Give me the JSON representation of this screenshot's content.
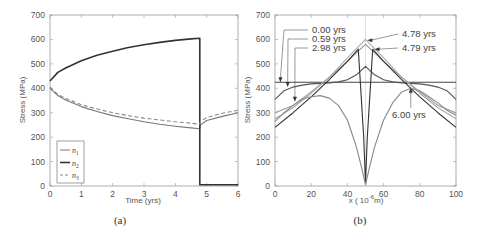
{
  "chart_data": [
    {
      "id": "a",
      "type": "line",
      "caption": "(a)",
      "title": "",
      "xlabel": "Time (yrs)",
      "ylabel": "Stress (MPa)",
      "xlim": [
        0,
        6
      ],
      "ylim": [
        0,
        700
      ],
      "xticks": [
        "0",
        "1",
        "2",
        "3",
        "4",
        "5",
        "6"
      ],
      "yticks": [
        "0",
        "100",
        "200",
        "300",
        "400",
        "500",
        "600",
        "700"
      ],
      "grid": false,
      "legend_position": "lower left",
      "series": [
        {
          "name": "n1",
          "label_base": "n",
          "label_sub": "1",
          "style": "solid-thin",
          "color": "#777777",
          "x": [
            0,
            0.25,
            0.5,
            1,
            1.5,
            2,
            2.5,
            3,
            3.5,
            4,
            4.5,
            4.78,
            4.8,
            5,
            5.5,
            6
          ],
          "y": [
            400,
            370,
            352,
            325,
            305,
            288,
            275,
            263,
            253,
            245,
            238,
            234,
            250,
            268,
            285,
            300
          ]
        },
        {
          "name": "n2",
          "label_base": "n",
          "label_sub": "2",
          "style": "solid-thick",
          "color": "#333333",
          "x": [
            0,
            0.25,
            0.5,
            1,
            1.5,
            2,
            2.5,
            3,
            3.5,
            4,
            4.5,
            4.78,
            4.78,
            4.8,
            5,
            5.5,
            6
          ],
          "y": [
            430,
            465,
            483,
            513,
            535,
            552,
            567,
            578,
            588,
            596,
            602,
            605,
            5,
            5,
            5,
            5,
            5
          ]
        },
        {
          "name": "n3",
          "label_base": "n",
          "label_sub": "3",
          "style": "dashed",
          "color": "#888888",
          "x": [
            0,
            0.25,
            0.5,
            1,
            1.5,
            2,
            2.5,
            3,
            3.5,
            4,
            4.5,
            4.78,
            4.8,
            5,
            5.5,
            6
          ],
          "y": [
            405,
            375,
            358,
            333,
            315,
            300,
            288,
            278,
            270,
            263,
            257,
            253,
            265,
            280,
            298,
            310
          ]
        }
      ]
    },
    {
      "id": "b",
      "type": "line",
      "caption": "(b)",
      "title": "",
      "xlabel": "x ( 10",
      "xlabel_sup": "-6",
      "xlabel_suffix": "m)",
      "ylabel": "Stress (MPa)",
      "xlim": [
        0,
        100
      ],
      "ylim": [
        0,
        700
      ],
      "xticks": [
        "0",
        "20",
        "40",
        "60",
        "80",
        "100"
      ],
      "yticks": [
        "0",
        "100",
        "200",
        "300",
        "400",
        "500",
        "600",
        "700"
      ],
      "grid": false,
      "vertical_reference_x": 50,
      "series": [
        {
          "name": "0.00 yrs",
          "color": "#444444",
          "x": [
            0,
            100
          ],
          "y": [
            425,
            425
          ]
        },
        {
          "name": "0.59 yrs",
          "color": "#555555",
          "x": [
            0,
            5,
            10,
            15,
            20,
            25,
            30,
            35,
            40,
            45,
            50,
            55,
            60,
            65,
            70,
            75,
            80,
            85,
            90,
            95,
            100
          ],
          "y": [
            355,
            390,
            405,
            413,
            418,
            420,
            422,
            426,
            435,
            455,
            490,
            455,
            435,
            426,
            422,
            420,
            418,
            413,
            405,
            390,
            355
          ]
        },
        {
          "name": "2.98 yrs",
          "color": "#999999",
          "x": [
            0,
            10,
            20,
            30,
            40,
            45,
            50,
            55,
            60,
            70,
            80,
            90,
            100
          ],
          "y": [
            300,
            330,
            385,
            445,
            510,
            545,
            580,
            545,
            510,
            445,
            385,
            330,
            300
          ]
        },
        {
          "name": "4.78 yrs",
          "color": "#aaaaaa",
          "x": [
            0,
            10,
            20,
            30,
            40,
            50,
            60,
            70,
            80,
            90,
            100
          ],
          "y": [
            275,
            320,
            380,
            445,
            525,
            600,
            525,
            445,
            380,
            320,
            275
          ]
        },
        {
          "name": "4.79 yrs",
          "color": "#333333",
          "x": [
            0,
            10,
            20,
            30,
            40,
            46,
            49,
            50,
            51,
            54,
            60,
            70,
            80,
            90,
            100
          ],
          "y": [
            240,
            300,
            365,
            435,
            510,
            560,
            200,
            10,
            200,
            560,
            510,
            435,
            365,
            300,
            240
          ]
        },
        {
          "name": "6.00 yrs",
          "color": "#888888",
          "x": [
            0,
            5,
            10,
            15,
            20,
            25,
            30,
            35,
            40,
            45,
            48,
            50,
            52,
            55,
            60,
            65,
            70,
            75,
            80,
            85,
            90,
            95,
            100
          ],
          "y": [
            265,
            300,
            330,
            355,
            365,
            370,
            360,
            330,
            270,
            160,
            70,
            5,
            70,
            160,
            270,
            340,
            385,
            400,
            390,
            365,
            340,
            310,
            290
          ]
        }
      ],
      "annotations": [
        {
          "text": "0.00 yrs",
          "arrow_to_x": 3,
          "arrow_to_y": 425
        },
        {
          "text": "0.59 yrs",
          "arrow_to_x": 7,
          "arrow_to_y": 405
        },
        {
          "text": "2.98 yrs",
          "arrow_to_x": 11,
          "arrow_to_y": 345
        },
        {
          "text": "4.78 yrs",
          "arrow_to_x": 51,
          "arrow_to_y": 597
        },
        {
          "text": "4.79 yrs",
          "arrow_to_x": 55,
          "arrow_to_y": 560
        },
        {
          "text": "6.00 yrs",
          "arrow_to_x": 75,
          "arrow_to_y": 402
        }
      ]
    }
  ]
}
